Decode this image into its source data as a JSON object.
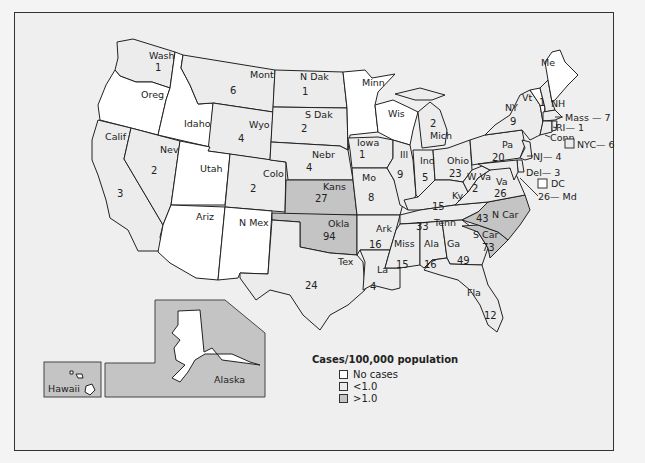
{
  "legend": {
    "title": "Cases/100,000 population",
    "items": [
      {
        "label": "No cases",
        "color": "#ffffff"
      },
      {
        "label": "<1.0",
        "color": "#ececec"
      },
      {
        "label": ">1.0",
        "color": "#c4c4c4"
      }
    ]
  },
  "colors": {
    "none": "#ffffff",
    "low": "#ececec",
    "high": "#c4c4c4",
    "frame_bg": "#efefef",
    "border": "#222222"
  },
  "states": {
    "wash": {
      "name": "Wash",
      "value": "1",
      "class": "<1.0"
    },
    "oreg": {
      "name": "Oreg",
      "value": "",
      "class": "No cases"
    },
    "calif": {
      "name": "Calif",
      "value": "3",
      "class": "<1.0"
    },
    "idaho": {
      "name": "Idaho",
      "value": "",
      "class": "No cases"
    },
    "nev": {
      "name": "Nev",
      "value": "2",
      "class": "<1.0"
    },
    "mont": {
      "name": "Mont",
      "value": "6",
      "class": "<1.0"
    },
    "wyo": {
      "name": "Wyo",
      "value": "4",
      "class": "<1.0"
    },
    "utah": {
      "name": "Utah",
      "value": "",
      "class": "No cases"
    },
    "colo": {
      "name": "Colo",
      "value": "2",
      "class": "<1.0"
    },
    "ariz": {
      "name": "Ariz",
      "value": "",
      "class": "No cases"
    },
    "nmex": {
      "name": "N Mex",
      "value": "",
      "class": "No cases"
    },
    "ndak": {
      "name": "N Dak",
      "value": "1",
      "class": "<1.0"
    },
    "sdak": {
      "name": "S Dak",
      "value": "2",
      "class": "<1.0"
    },
    "nebr": {
      "name": "Nebr",
      "value": "4",
      "class": "<1.0"
    },
    "kans": {
      "name": "Kans",
      "value": "27",
      "class": ">1.0"
    },
    "okla": {
      "name": "Okla",
      "value": "94",
      "class": ">1.0"
    },
    "tex": {
      "name": "Tex",
      "value": "24",
      "class": "<1.0"
    },
    "minn": {
      "name": "Minn",
      "value": "",
      "class": "No cases"
    },
    "iowa": {
      "name": "Iowa",
      "value": "1",
      "class": "<1.0"
    },
    "mo": {
      "name": "Mo",
      "value": "8",
      "class": "<1.0"
    },
    "ark": {
      "name": "Ark",
      "value": "16",
      "class": "<1.0"
    },
    "la": {
      "name": "La",
      "value": "4",
      "class": "<1.0"
    },
    "wis": {
      "name": "Wis",
      "value": "",
      "class": "No cases"
    },
    "ill": {
      "name": "Ill",
      "value": "9",
      "class": "<1.0"
    },
    "mich": {
      "name": "Mich",
      "value": "2",
      "class": "<1.0"
    },
    "ind": {
      "name": "Ind",
      "value": "5",
      "class": "<1.0"
    },
    "ohio": {
      "name": "Ohio",
      "value": "23",
      "class": "<1.0"
    },
    "ky": {
      "name": "Ky",
      "value": "15",
      "class": "<1.0"
    },
    "tenn": {
      "name": "Tenn",
      "value": "33",
      "class": "<1.0"
    },
    "miss": {
      "name": "Miss",
      "value": "15",
      "class": "<1.0"
    },
    "ala": {
      "name": "Ala",
      "value": "16",
      "class": "<1.0"
    },
    "ga": {
      "name": "Ga",
      "value": "49",
      "class": "<1.0"
    },
    "fla": {
      "name": "Fla",
      "value": "12",
      "class": "<1.0"
    },
    "scar": {
      "name": "S Car",
      "value": "73",
      "class": ">1.0"
    },
    "ncar": {
      "name": "N Car",
      "value": "43",
      "class": ">1.0"
    },
    "va": {
      "name": "Va",
      "value": "26",
      "class": "<1.0"
    },
    "wva": {
      "name": "W Va",
      "value": "2",
      "class": "<1.0"
    },
    "pa": {
      "name": "Pa",
      "value": "20",
      "class": "<1.0"
    },
    "ny": {
      "name": "NY",
      "value": "9",
      "class": "<1.0"
    },
    "vt": {
      "name": "Vt",
      "value": "",
      "class": "No cases"
    },
    "nh": {
      "name": "NH",
      "value": "1",
      "class": "<1.0"
    },
    "me": {
      "name": "Me",
      "value": "",
      "class": "No cases"
    },
    "mass": {
      "name": "Mass",
      "value": "7",
      "label": "Mass — 7",
      "class": "<1.0"
    },
    "ri": {
      "name": "RI",
      "value": "1",
      "label": "RI— 1",
      "class": "<1.0"
    },
    "conn": {
      "name": "Conn",
      "value": "",
      "label": "Conn",
      "class": "<1.0"
    },
    "nyc": {
      "name": "NYC",
      "value": "6",
      "label": "NYC— 6",
      "class": "<1.0"
    },
    "nj": {
      "name": "NJ",
      "value": "4",
      "label": "NJ— 4",
      "class": "<1.0"
    },
    "del": {
      "name": "Del",
      "value": "3",
      "label": "Del— 3",
      "class": "<1.0"
    },
    "dc": {
      "name": "DC",
      "value": "",
      "label": "DC",
      "class": "No cases"
    },
    "md": {
      "name": "Md",
      "value": "26",
      "label": "26— Md",
      "class": "<1.0"
    },
    "alaska": {
      "name": "Alaska",
      "value": "",
      "class": "No cases"
    },
    "hawaii": {
      "name": "Hawaii",
      "value": "",
      "class": "No cases"
    }
  }
}
